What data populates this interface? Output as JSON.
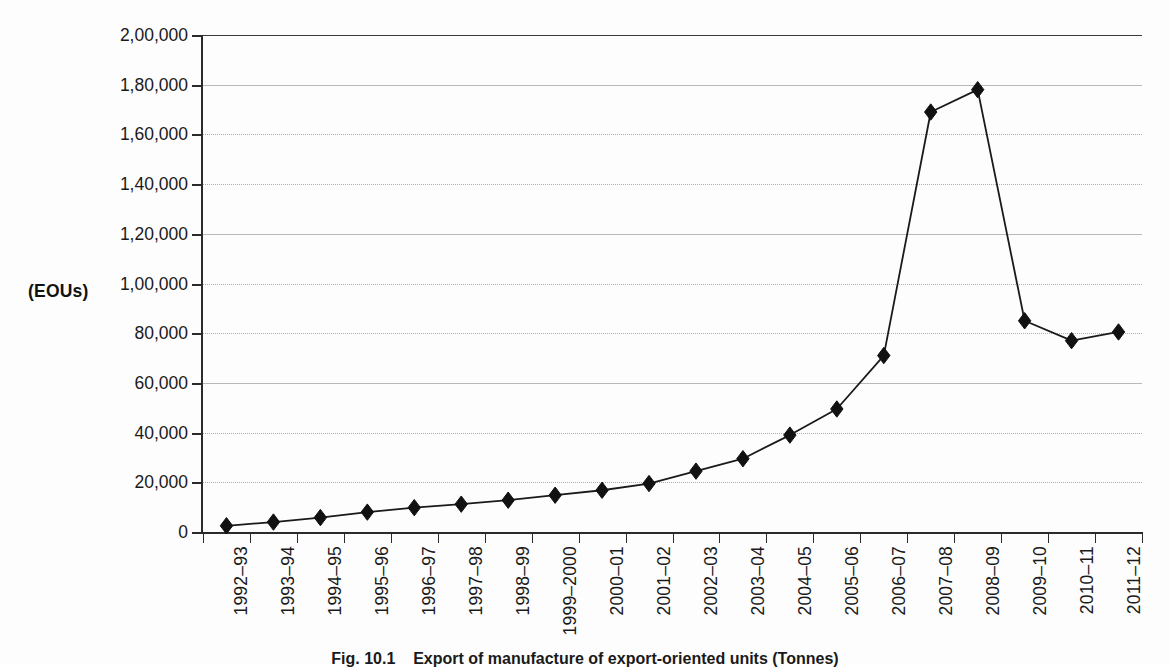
{
  "figure": {
    "unit_label": "(EOUs)",
    "caption_number": "Fig. 10.1",
    "caption_text": "Export of manufacture of export-oriented units (Tonnes)"
  },
  "chart_data": {
    "type": "line",
    "title": "",
    "subtitle": "",
    "xlabel": "",
    "ylabel": "(EOUs)",
    "ylim": [
      0,
      200000
    ],
    "ytick_step": 20000,
    "grid": true,
    "legend": "none",
    "marker": "diamond",
    "line_color": "#1a1a1a",
    "marker_color": "#111111",
    "grid_color": "#b0b0b0",
    "axis_color": "#2b2b2b",
    "background_color": "#fdfdfd",
    "ytick_labels": [
      "0",
      "20,000",
      "40,000",
      "60,000",
      "80,000",
      "1,00,000",
      "1,20,000",
      "1,40,000",
      "1,60,000",
      "1,80,000",
      "2,00,000"
    ],
    "ytick_values": [
      0,
      20000,
      40000,
      60000,
      80000,
      100000,
      120000,
      140000,
      160000,
      180000,
      200000
    ],
    "categories": [
      "1992–93",
      "1993–94",
      "1994–95",
      "1995–96",
      "1996–97",
      "1997–98",
      "1998–99",
      "1999–2000",
      "2000–01",
      "2001–02",
      "2002–03",
      "2003–04",
      "2004–05",
      "2005–06",
      "2006–07",
      "2007–08",
      "2008–09",
      "2009–10",
      "2010–11",
      "2011–12"
    ],
    "values": [
      2500,
      4000,
      5800,
      8000,
      9800,
      11200,
      12800,
      14800,
      16800,
      19500,
      24500,
      29500,
      39000,
      49500,
      71000,
      169000,
      178000,
      85000,
      77000,
      80500
    ],
    "series": [
      {
        "name": "EOUs",
        "values": [
          2500,
          4000,
          5800,
          8000,
          9800,
          11200,
          12800,
          14800,
          16800,
          19500,
          24500,
          29500,
          39000,
          49500,
          71000,
          169000,
          178000,
          85000,
          77000,
          80500
        ]
      }
    ]
  }
}
